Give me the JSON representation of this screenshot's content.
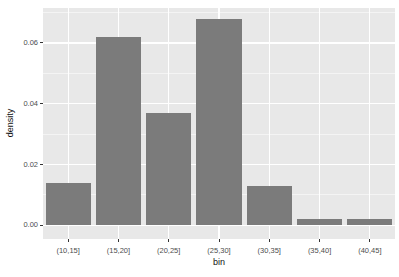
{
  "chart_data": {
    "type": "bar",
    "title": "",
    "xlabel": "bin",
    "ylabel": "density",
    "categories": [
      "(10,15]",
      "(15,20]",
      "(20,25]",
      "(25,30]",
      "(30,35]",
      "(35,40]",
      "(40,45]"
    ],
    "values": [
      0.014,
      0.062,
      0.037,
      0.068,
      0.013,
      0.002,
      0.002
    ],
    "ylim": [
      -0.0045,
      0.0715
    ],
    "y_major_ticks": {
      "values": [
        0,
        0.02,
        0.04,
        0.06
      ],
      "labels": [
        "0.00",
        "0.02",
        "0.04",
        "0.06"
      ]
    },
    "y_minor_ticks": [
      0.01,
      0.03,
      0.05,
      0.07
    ],
    "grid": "on",
    "legend": "none",
    "bar_width_fraction": 0.9,
    "style": {
      "figure_bg": "#ffffff",
      "panel_bg": "#e8e8e8",
      "bar_fill": "#7b7b7b",
      "grid_major_color": "#ffffff",
      "grid_minor_color": "#f4f4f4",
      "tick_label_color": "#4d4d4d",
      "axis_title_color": "#111111",
      "tick_mark_color": "#333333"
    }
  }
}
